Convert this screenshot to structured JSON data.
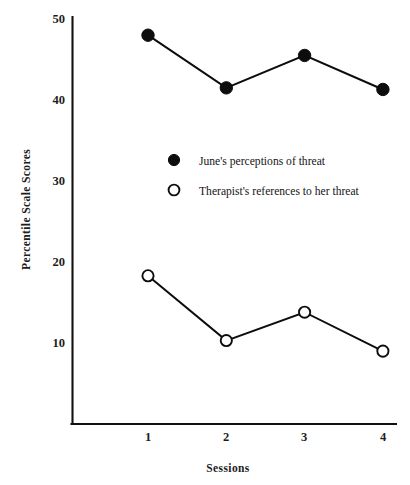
{
  "chart_data": {
    "type": "line",
    "title": "",
    "xlabel": "Sessions",
    "ylabel": "Percentile  Scale  Scores",
    "x": [
      1,
      2,
      3,
      4
    ],
    "categories": [
      "1",
      "2",
      "3",
      "4"
    ],
    "xtick_labels": [
      "1",
      "2",
      "3",
      "4"
    ],
    "ytick_labels": [
      "10",
      "20",
      "30",
      "40",
      "50"
    ],
    "yticks": [
      10,
      20,
      30,
      40,
      50
    ],
    "xlim": [
      0.35,
      4.35
    ],
    "ylim": [
      0,
      50
    ],
    "grid": false,
    "legend_position": "center",
    "series": [
      {
        "name": "June's perceptions of threat",
        "marker": "filled-circle",
        "color": "#0d0d0d",
        "values": [
          48.0,
          41.5,
          45.5,
          41.3
        ]
      },
      {
        "name": "Therapist's references to her threat",
        "marker": "open-circle",
        "color": "#0d0d0d",
        "values": [
          18.3,
          10.3,
          13.8,
          9.0
        ]
      }
    ]
  },
  "legend": {
    "items": [
      {
        "label": "June's perceptions of threat",
        "marker": "filled-circle"
      },
      {
        "label": "Therapist's references to her threat",
        "marker": "open-circle"
      }
    ]
  },
  "axes": {
    "y_title": "Percentile  Scale  Scores",
    "x_title": "Sessions",
    "y_ticks": [
      "50",
      "40",
      "30",
      "20",
      "10"
    ],
    "x_ticks": [
      "1",
      "2",
      "3",
      "4"
    ]
  }
}
